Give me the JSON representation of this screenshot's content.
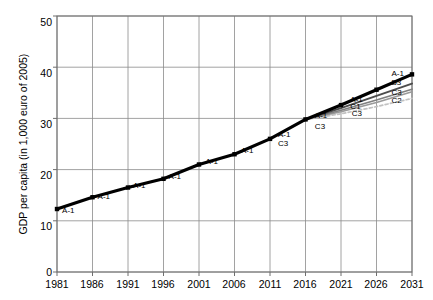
{
  "chart_data": {
    "type": "line",
    "title": "",
    "xlabel": "",
    "ylabel": "GDP per capita (in 1,000 euro of 2005)",
    "xlim": [
      1981,
      2031
    ],
    "ylim": [
      0,
      50
    ],
    "xticks": [
      "1981",
      "1986",
      "1991",
      "1996",
      "2001",
      "2006",
      "2011",
      "2016",
      "2021",
      "2026",
      "2031"
    ],
    "yticks": [
      "0",
      "10",
      "20",
      "30",
      "40",
      "50"
    ],
    "grid": true,
    "legend": "inline-series-labels-on-line",
    "series": [
      {
        "name": "A-1",
        "color": "#000000",
        "style": "solid",
        "x": [
          1981,
          1986,
          1991,
          1996,
          2001,
          2006,
          2011,
          2016,
          2021,
          2026,
          2031
        ],
        "values": [
          12.3,
          14.6,
          16.5,
          18.2,
          21.0,
          23.0,
          26.0,
          29.8,
          32.6,
          35.6,
          38.6
        ]
      },
      {
        "name": "B3",
        "color": "#4d4d4d",
        "style": "solid",
        "x": [
          2016,
          2021,
          2026,
          2031
        ],
        "values": [
          29.8,
          32.0,
          34.4,
          36.8
        ]
      },
      {
        "name": "C1",
        "color": "#808080",
        "style": "solid",
        "x": [
          2016,
          2021,
          2026,
          2031
        ],
        "values": [
          29.8,
          31.6,
          33.6,
          35.7
        ]
      },
      {
        "name": "C3",
        "color": "#9a9a9a",
        "style": "solid",
        "x": [
          2016,
          2021,
          2026,
          2031
        ],
        "values": [
          29.8,
          31.3,
          33.1,
          35.2
        ]
      },
      {
        "name": "C2",
        "color": "#c2c2c2",
        "style": "dashed",
        "x": [
          2016,
          2021,
          2026,
          2031
        ],
        "values": [
          29.8,
          30.9,
          32.3,
          33.9
        ]
      }
    ],
    "point_labels": [
      {
        "text": "A-1",
        "x": 1982.0,
        "y": 12.0,
        "series": "A-1"
      },
      {
        "text": "A-1",
        "x": 1987.0,
        "y": 14.6,
        "series": "A-1"
      },
      {
        "text": "A-1",
        "x": 1992.0,
        "y": 16.7,
        "series": "A-1"
      },
      {
        "text": "A-1",
        "x": 1997.0,
        "y": 18.5,
        "series": "A-1"
      },
      {
        "text": "A-1",
        "x": 2002.2,
        "y": 21.5,
        "series": "A-1"
      },
      {
        "text": "A-1",
        "x": 2007.2,
        "y": 23.6,
        "series": "A-1"
      },
      {
        "text": "A-1",
        "x": 2012.4,
        "y": 26.8,
        "series": "A-1"
      },
      {
        "text": "C3",
        "x": 2012.4,
        "y": 25.0,
        "series": "C3"
      },
      {
        "text": "A-1",
        "x": 2017.6,
        "y": 30.4,
        "series": "A-1"
      },
      {
        "text": "C3",
        "x": 2017.6,
        "y": 28.4,
        "series": "C3"
      },
      {
        "text": "A-1",
        "x": 2022.6,
        "y": 33.6,
        "series": "A-1"
      },
      {
        "text": "C1",
        "x": 2022.6,
        "y": 32.3,
        "series": "C1"
      },
      {
        "text": "C3",
        "x": 2022.8,
        "y": 30.9,
        "series": "C3"
      },
      {
        "text": "A-1",
        "x": 2028.4,
        "y": 38.6,
        "series": "A-1"
      },
      {
        "text": "B3",
        "x": 2028.4,
        "y": 36.9,
        "series": "B3"
      },
      {
        "text": "C3",
        "x": 2028.4,
        "y": 35.0,
        "series": "C3"
      },
      {
        "text": "C2",
        "x": 2028.4,
        "y": 33.4,
        "series": "C2"
      }
    ]
  },
  "labels": {
    "ylabel": "GDP per capita (in 1,000 euro of 2005)",
    "y0": "0",
    "y1": "10",
    "y2": "20",
    "y3": "30",
    "y4": "40",
    "y5": "50",
    "x0": "1981",
    "x1": "1986",
    "x2": "1991",
    "x3": "1996",
    "x4": "2001",
    "x5": "2006",
    "x6": "2011",
    "x7": "2016",
    "x8": "2021",
    "x9": "2026",
    "x10": "2031"
  },
  "colors": {
    "axis": "#6e6e6e",
    "grid": "#8a8a8a",
    "a1": "#000000",
    "b3": "#4d4d4d",
    "c1": "#808080",
    "c3": "#9a9a9a",
    "c2": "#c2c2c2"
  }
}
